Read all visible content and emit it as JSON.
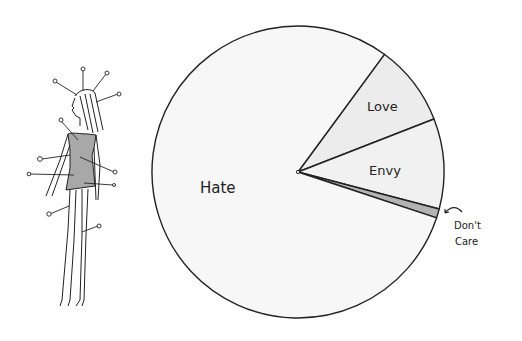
{
  "chart_data": {
    "type": "pie",
    "title": "",
    "center": [
      298,
      172
    ],
    "radius": 146,
    "start_angle_deg": -53.7,
    "slices": [
      {
        "label": "Love",
        "value": 9,
        "color": "#ececec"
      },
      {
        "label": "Envy",
        "value": 10,
        "color": "#f1f1f1"
      },
      {
        "label": "Don't Care",
        "value": 1,
        "color": "#b3b3b3"
      },
      {
        "label": "Hate",
        "value": 80,
        "color": "#f7f7f7"
      }
    ],
    "labels": [
      {
        "text": "Love",
        "x": 367,
        "y": 111,
        "size": 13
      },
      {
        "text": "Envy",
        "x": 369,
        "y": 175,
        "size": 13
      },
      {
        "text": "Hate",
        "x": 200,
        "y": 193,
        "size": 15
      },
      {
        "text": "Don't",
        "x": 454,
        "y": 229,
        "size": 10
      },
      {
        "text": "Care",
        "x": 455,
        "y": 245,
        "size": 10
      }
    ],
    "annotations": [
      "Arrow pointing from 'Don't Care' label to the thin grey slice"
    ],
    "legend": "none (labels drawn inside slices)"
  },
  "illustration": {
    "subject": "Woman figure with pins stuck in her (voodoo doll)",
    "outline_color": "#222222",
    "dress_color": "#a8a8a8"
  }
}
